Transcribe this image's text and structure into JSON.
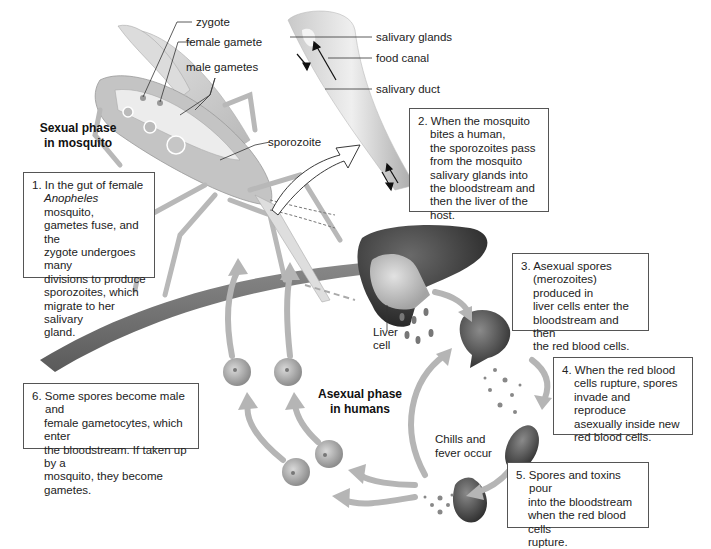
{
  "diagram": {
    "colors": {
      "background": "#ffffff",
      "box_border": "#555555",
      "arrow_fill": "#b5b5b5",
      "cell_light": "#bdbdbd",
      "cell_dark": "#555555",
      "liver": "#3a3a3a"
    },
    "phases": {
      "sexual": [
        "Sexual phase",
        "in mosquito"
      ],
      "asexual": [
        "Asexual phase",
        "in humans"
      ]
    },
    "mosquito_labels": {
      "zygote": "zygote",
      "female_gamete": "female gamete",
      "male_gametes": "male gametes",
      "sporozoite": "sporozoite"
    },
    "proboscis_labels": {
      "salivary_glands": "salivary glands",
      "food_canal": "food canal",
      "salivary_duct": "salivary duct"
    },
    "liver_label": [
      "Liver",
      "cell"
    ],
    "symptom_label": [
      "Chills and",
      "fever occur"
    ],
    "steps": [
      {
        "number": "1.",
        "lines_pre": "In the gut of female",
        "italic": "Anopheles",
        "lines_post_first": " mosquito,",
        "lines": [
          "gametes fuse, and the",
          "zygote undergoes many",
          "divisions to produce",
          "sporozoites, which",
          "migrate to her salivary",
          "gland."
        ]
      },
      {
        "number": "2.",
        "first": "When the mosquito",
        "lines": [
          "bites a human,",
          "the sporozoites pass",
          "from the mosquito",
          "salivary glands into",
          "the bloodstream and",
          "then the liver of the host."
        ]
      },
      {
        "number": "3.",
        "first": "Asexual spores",
        "lines": [
          "(merozoites) produced in",
          "liver cells enter the",
          "bloodstream and then",
          "the red blood cells."
        ]
      },
      {
        "number": "4.",
        "first": "When the red blood",
        "lines": [
          "cells rupture, spores",
          "invade and reproduce",
          "asexually inside new",
          "red blood cells."
        ]
      },
      {
        "number": "5.",
        "first": "Spores and toxins pour",
        "lines": [
          "into the bloodstream",
          "when the red blood cells",
          "rupture."
        ]
      },
      {
        "number": "6.",
        "first": "Some spores become male and",
        "lines": [
          "female gametocytes, which enter",
          "the bloodstream. If taken up by a",
          "mosquito, they become gametes."
        ]
      }
    ]
  }
}
